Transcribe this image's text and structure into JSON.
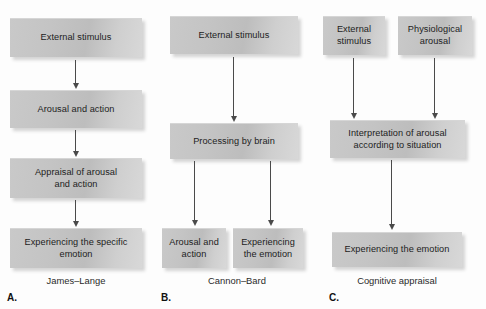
{
  "figure": {
    "background_color": "#fdfdfd",
    "box_fill_light": "#d8d8d8",
    "box_fill_dark": "#bdbdbd",
    "arrow_color": "#4a4a4a",
    "text_color": "#1d1d1d"
  },
  "panels": [
    {
      "letter": "A.",
      "caption": "James–Lange",
      "boxes": [
        {
          "id": "a1",
          "text": "External stimulus"
        },
        {
          "id": "a2",
          "text": "Arousal and action"
        },
        {
          "id": "a3",
          "line1": "Appraisal of arousal",
          "line2": "and action"
        },
        {
          "id": "a4",
          "line1": "Experiencing the specific",
          "line2": "emotion"
        }
      ]
    },
    {
      "letter": "B.",
      "caption": "Cannon–Bard",
      "boxes": [
        {
          "id": "b1",
          "text": "External stimulus"
        },
        {
          "id": "b2",
          "text": "Processing by brain"
        },
        {
          "id": "b3",
          "line1": "Arousal and",
          "line2": "action"
        },
        {
          "id": "b4",
          "line1": "Experiencing",
          "line2": "the emotion"
        }
      ]
    },
    {
      "letter": "C.",
      "caption": "Cognitive appraisal",
      "boxes": [
        {
          "id": "c1",
          "line1": "External",
          "line2": "stimulus"
        },
        {
          "id": "c2",
          "line1": "Physiological",
          "line2": "arousal"
        },
        {
          "id": "c3",
          "line1": "Interpretation of arousal",
          "line2": "according to situation"
        },
        {
          "id": "c4",
          "text": "Experiencing the emotion"
        }
      ]
    }
  ]
}
